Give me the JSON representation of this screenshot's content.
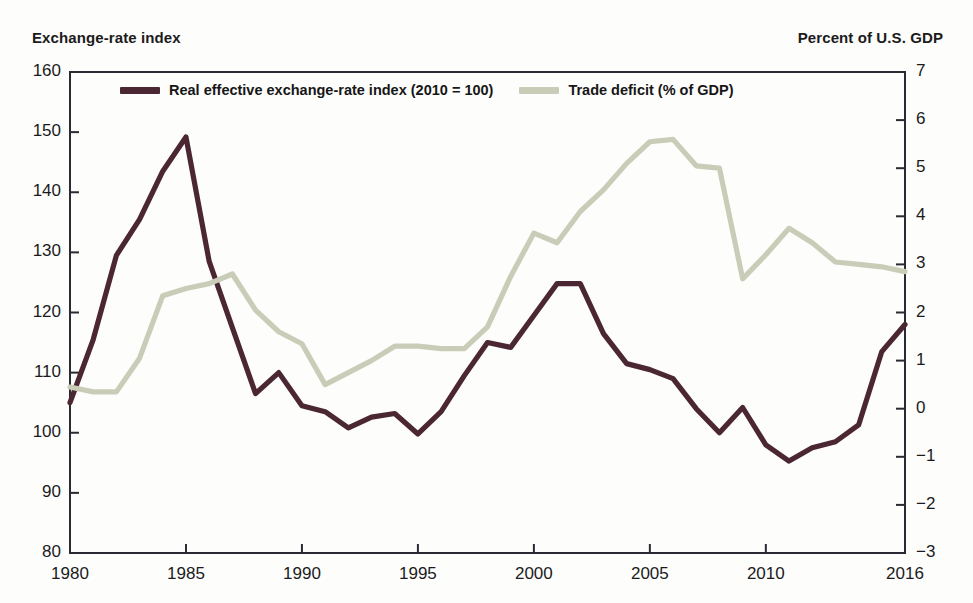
{
  "figure": {
    "left_axis_caption": "Exchange-rate index",
    "right_axis_caption": "Percent of U.S. GDP"
  },
  "legend": {
    "items": [
      {
        "label": "Real effective exchange-rate index (2010 = 100)",
        "color": "#4b2633",
        "name": "legend-exchange-rate"
      },
      {
        "label": "Trade deficit (% of GDP)",
        "color": "#c9cdb7",
        "name": "legend-trade-deficit"
      }
    ]
  },
  "chart_data": {
    "type": "line",
    "title": "",
    "subtitle": "",
    "xlabel": "",
    "ylabel": "Exchange-rate index",
    "y2label": "Percent of U.S. GDP",
    "grid": false,
    "legend_position": "top-inside",
    "xlim": [
      1980,
      2016
    ],
    "ylim": [
      80,
      160
    ],
    "y2lim": [
      -3,
      7
    ],
    "xticks": [
      1980,
      1985,
      1990,
      1995,
      2000,
      2005,
      2010,
      2016
    ],
    "xtick_labels": [
      "1980",
      "1985",
      "1990",
      "1995",
      "2000",
      "2005",
      "2010",
      "2016"
    ],
    "yticks": [
      80,
      90,
      100,
      110,
      120,
      130,
      140,
      150,
      160
    ],
    "ytick_labels": [
      "80",
      "90",
      "100",
      "110",
      "120",
      "130",
      "140",
      "150",
      "160"
    ],
    "y2ticks": [
      -3,
      -2,
      -1,
      0,
      1,
      2,
      3,
      4,
      5,
      6,
      7
    ],
    "y2tick_labels": [
      "−3",
      "−2",
      "−1",
      "0",
      "1",
      "2",
      "3",
      "4",
      "5",
      "6",
      "7"
    ],
    "x": [
      1980,
      1981,
      1982,
      1983,
      1984,
      1985,
      1986,
      1987,
      1988,
      1989,
      1990,
      1991,
      1992,
      1993,
      1994,
      1995,
      1996,
      1997,
      1998,
      1999,
      2000,
      2001,
      2002,
      2003,
      2004,
      2005,
      2006,
      2007,
      2008,
      2009,
      2010,
      2011,
      2012,
      2013,
      2014,
      2015,
      2016
    ],
    "series": [
      {
        "name": "Real effective exchange-rate index (2010 = 100)",
        "color": "#4b2633",
        "axis": "left",
        "values": [
          105.0,
          115.5,
          129.5,
          135.5,
          143.5,
          149.2,
          128.5,
          117.5,
          106.5,
          110.0,
          104.5,
          103.5,
          100.8,
          102.6,
          103.2,
          99.8,
          103.5,
          109.5,
          115.0,
          114.2,
          119.5,
          124.8,
          124.8,
          116.5,
          111.5,
          110.5,
          109.0,
          104.0,
          100.0,
          104.2,
          98.0,
          95.3,
          97.5,
          98.5,
          101.3,
          113.5,
          118.0
        ]
      },
      {
        "name": "Trade deficit (% of GDP)",
        "color": "#c9cdb7",
        "axis": "right",
        "values": [
          0.45,
          0.35,
          0.35,
          1.05,
          2.35,
          2.5,
          2.6,
          2.8,
          2.05,
          1.6,
          1.35,
          0.5,
          0.75,
          1.0,
          1.3,
          1.3,
          1.25,
          1.25,
          1.7,
          2.75,
          3.65,
          3.45,
          4.1,
          4.55,
          5.1,
          5.55,
          5.6,
          5.05,
          5.0,
          2.7,
          3.2,
          3.75,
          3.45,
          3.05,
          3.0,
          2.95,
          2.85
        ]
      }
    ]
  }
}
